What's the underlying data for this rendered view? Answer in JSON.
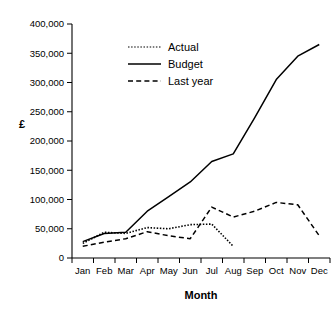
{
  "chart_data": {
    "type": "line",
    "title": "",
    "xlabel": "Month",
    "ylabel": "£",
    "categories": [
      "Jan",
      "Feb",
      "Mar",
      "Apr",
      "May",
      "Jun",
      "Jul",
      "Aug",
      "Sep",
      "Oct",
      "Nov",
      "Dec"
    ],
    "ylim": [
      0,
      400000
    ],
    "ytick_values": [
      0,
      50000,
      100000,
      150000,
      200000,
      250000,
      300000,
      350000,
      400000
    ],
    "ytick_labels": [
      "0",
      "50,000",
      "100,000",
      "150,000",
      "200,000",
      "250,000",
      "300,000",
      "350,000",
      "400,000"
    ],
    "grid": false,
    "legend_position": "upper-center-left",
    "series": [
      {
        "name": "Actual",
        "style": "dotted",
        "color": "#555555",
        "values": [
          25000,
          44000,
          42000,
          52000,
          50000,
          57000,
          58000,
          20000,
          null,
          null,
          null,
          null
        ]
      },
      {
        "name": "Budget",
        "style": "solid",
        "color": "#000000",
        "values": [
          28000,
          42000,
          44000,
          80000,
          105000,
          130000,
          165000,
          178000,
          240000,
          305000,
          345000,
          365000
        ]
      },
      {
        "name": "Last year",
        "style": "dashed",
        "color": "#000000",
        "values": [
          20000,
          27000,
          33000,
          45000,
          38000,
          33000,
          87000,
          70000,
          80000,
          95000,
          91000,
          38000
        ]
      }
    ]
  },
  "axes": {
    "y_axis_title": "£",
    "x_axis_title": "Month"
  },
  "legend": {
    "items": [
      {
        "label": "Actual"
      },
      {
        "label": "Budget"
      },
      {
        "label": "Last year"
      }
    ]
  }
}
